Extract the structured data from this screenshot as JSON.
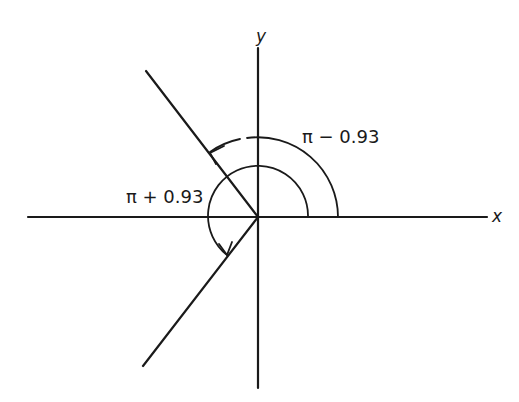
{
  "diagram": {
    "type": "angle-diagram",
    "axes": {
      "x_label": "x",
      "y_label": "y"
    },
    "angles": [
      {
        "label": "π − 0.93",
        "description": "counterclockwise arc from positive x-axis to ray in second quadrant"
      },
      {
        "label": "π + 0.93",
        "description": "counterclockwise arc from positive x-axis to ray in third quadrant"
      }
    ],
    "rays": [
      {
        "name": "second-quadrant-ray",
        "angle": "π − 0.93"
      },
      {
        "name": "third-quadrant-ray",
        "angle": "π + 0.93"
      }
    ],
    "colors": {
      "line": "#1a1a1a",
      "background": "#ffffff"
    }
  }
}
